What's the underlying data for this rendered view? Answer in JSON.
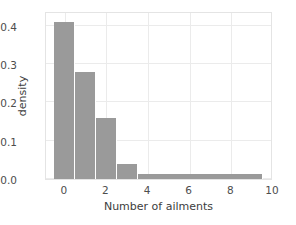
{
  "chart_data": {
    "type": "bar",
    "title": "",
    "xlabel": "Number of ailments",
    "ylabel": "density",
    "xlim": [
      -0.9,
      10.0
    ],
    "ylim": [
      0.0,
      0.438
    ],
    "grid": true,
    "legend": null,
    "bar_color": "#9a9a9a",
    "grid_color": "#ebebeb",
    "axes_color": "#e4e4e4",
    "tick_label_color": "#4d4d4d",
    "xticks": [
      "0",
      "2",
      "4",
      "6",
      "8",
      "10"
    ],
    "xtick_values": [
      0,
      2,
      4,
      6,
      8,
      10
    ],
    "yticks": [
      "0.0",
      "0.1",
      "0.2",
      "0.3",
      "0.4"
    ],
    "ytick_values": [
      0.0,
      0.1,
      0.2,
      0.3,
      0.4
    ],
    "bins": [
      {
        "label": "0",
        "left": -0.5,
        "right": 0.5,
        "value": 0.41
      },
      {
        "label": "1",
        "left": 0.5,
        "right": 1.5,
        "value": 0.28
      },
      {
        "label": "2",
        "left": 1.5,
        "right": 2.5,
        "value": 0.16
      },
      {
        "label": "3",
        "left": 2.5,
        "right": 3.5,
        "value": 0.038
      },
      {
        "label": "4-9",
        "left": 3.5,
        "right": 9.5,
        "value": 0.013
      }
    ],
    "categories": [
      "0",
      "1",
      "2",
      "3",
      "4-9"
    ],
    "values": [
      0.41,
      0.28,
      0.16,
      0.038,
      0.013
    ]
  }
}
